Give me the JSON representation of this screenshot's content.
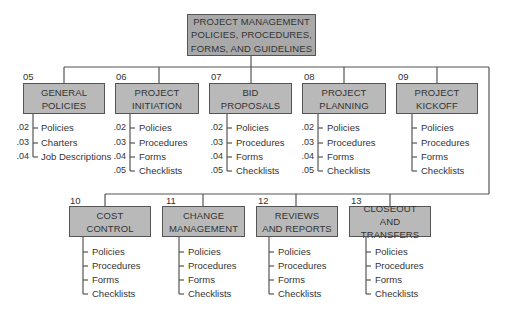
{
  "root": {
    "lines": [
      "PROJECT MANAGEMENT",
      "POLICIES, PROCEDURES,",
      "FORMS, AND GUIDELINES"
    ]
  },
  "sections": [
    {
      "code": "05",
      "lines": [
        "GENERAL",
        "POLICIES"
      ],
      "items": [
        {
          "num": ".02",
          "label": "Policies"
        },
        {
          "num": ".03",
          "label": "Charters"
        },
        {
          "num": ".04",
          "label": "Job Descriptions"
        }
      ]
    },
    {
      "code": "06",
      "lines": [
        "PROJECT",
        "INITIATION"
      ],
      "items": [
        {
          "num": ".02",
          "label": "Policies"
        },
        {
          "num": ".03",
          "label": "Procedures"
        },
        {
          "num": ".04",
          "label": "Forms"
        },
        {
          "num": ".05",
          "label": "Checklists"
        }
      ]
    },
    {
      "code": "07",
      "lines": [
        "BID",
        "PROPOSALS"
      ],
      "items": [
        {
          "num": ".02",
          "label": "Policies"
        },
        {
          "num": ".03",
          "label": "Procedures"
        },
        {
          "num": ".04",
          "label": "Forms"
        },
        {
          "num": ".05",
          "label": "Checklists"
        }
      ]
    },
    {
      "code": "08",
      "lines": [
        "PROJECT",
        "PLANNING"
      ],
      "items": [
        {
          "num": ".02",
          "label": "Policies"
        },
        {
          "num": ".03",
          "label": "Procedures"
        },
        {
          "num": ".04",
          "label": "Forms"
        },
        {
          "num": ".05",
          "label": "Checklists"
        }
      ]
    },
    {
      "code": "09",
      "lines": [
        "PROJECT",
        "KICKOFF"
      ],
      "items": [
        {
          "num": "",
          "label": "Policies"
        },
        {
          "num": "",
          "label": "Procedures"
        },
        {
          "num": "",
          "label": "Forms"
        },
        {
          "num": "",
          "label": "Checklists"
        }
      ]
    },
    {
      "code": "10",
      "lines": [
        "COST",
        "CONTROL"
      ],
      "items": [
        {
          "num": "",
          "label": "Policies"
        },
        {
          "num": "",
          "label": "Procedures"
        },
        {
          "num": "",
          "label": "Forms"
        },
        {
          "num": "",
          "label": "Checklists"
        }
      ]
    },
    {
      "code": "11",
      "lines": [
        "CHANGE",
        "MANAGEMENT"
      ],
      "items": [
        {
          "num": "",
          "label": "Policies"
        },
        {
          "num": "",
          "label": "Procedures"
        },
        {
          "num": "",
          "label": "Forms"
        },
        {
          "num": "",
          "label": "Checklists"
        }
      ]
    },
    {
      "code": "12",
      "lines": [
        "REVIEWS",
        "AND REPORTS"
      ],
      "items": [
        {
          "num": "",
          "label": "Policies"
        },
        {
          "num": "",
          "label": "Procedures"
        },
        {
          "num": "",
          "label": "Forms"
        },
        {
          "num": "",
          "label": "Checklists"
        }
      ]
    },
    {
      "code": "13",
      "lines": [
        "CLOSEOUT",
        "AND TRANSFERS"
      ],
      "items": [
        {
          "num": "",
          "label": "Policies"
        },
        {
          "num": "",
          "label": "Procedures"
        },
        {
          "num": "",
          "label": "Forms"
        },
        {
          "num": "",
          "label": "Checklists"
        }
      ]
    }
  ],
  "colors": {
    "box_fill": "#b9b9b9",
    "root_fill": "#a9a9a9",
    "line": "#555555",
    "text": "#333333"
  }
}
